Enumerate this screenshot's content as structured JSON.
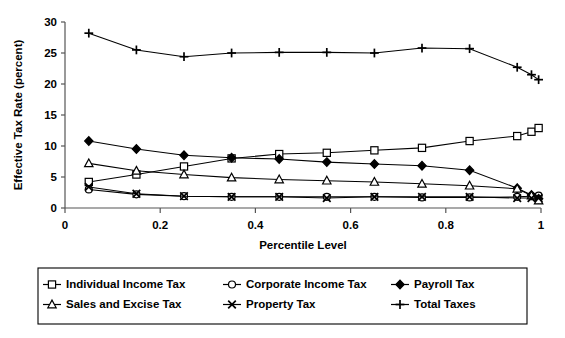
{
  "chart_data": {
    "type": "line",
    "title": "",
    "xlabel": "Percentile Level",
    "ylabel": "Effective Tax Rate (percent)",
    "xlim": [
      0,
      1
    ],
    "ylim": [
      0,
      30
    ],
    "xticks": [
      0,
      0.2,
      0.4,
      0.6,
      0.8,
      1
    ],
    "xticklabels": [
      "0",
      "0.2",
      "0.4",
      "0.6",
      "0.8",
      "1"
    ],
    "yticks": [
      0,
      5,
      10,
      15,
      20,
      25,
      30
    ],
    "yticklabels": [
      "0",
      "5",
      "10",
      "15",
      "20",
      "25",
      "30"
    ],
    "grid": false,
    "legend_position": "below-plot",
    "x": [
      0.05,
      0.15,
      0.25,
      0.35,
      0.45,
      0.55,
      0.65,
      0.75,
      0.85,
      0.95,
      0.98,
      0.995
    ],
    "series": [
      {
        "name": "Individual Income Tax",
        "marker": "square-open",
        "values": [
          4.2,
          5.4,
          6.7,
          8.0,
          8.7,
          8.9,
          9.3,
          9.7,
          10.8,
          11.6,
          12.3,
          12.9
        ]
      },
      {
        "name": "Corporate Income Tax",
        "marker": "circle-open",
        "values": [
          3.0,
          2.2,
          1.9,
          1.8,
          1.8,
          1.8,
          1.8,
          1.7,
          1.7,
          1.8,
          1.9,
          2.0
        ]
      },
      {
        "name": "Payroll Tax",
        "marker": "diamond-solid",
        "values": [
          10.8,
          9.5,
          8.5,
          8.1,
          7.9,
          7.4,
          7.1,
          6.8,
          6.1,
          3.2,
          2.1,
          1.5
        ]
      },
      {
        "name": "Sales and Excise Tax",
        "marker": "triangle-open",
        "values": [
          7.2,
          6.0,
          5.4,
          4.9,
          4.6,
          4.4,
          4.2,
          3.9,
          3.6,
          3.1,
          2.0,
          1.2
        ]
      },
      {
        "name": "Property Tax",
        "marker": "x-cross",
        "values": [
          3.4,
          2.3,
          1.9,
          1.8,
          1.8,
          1.6,
          1.8,
          1.8,
          1.8,
          1.6,
          1.6,
          1.6
        ]
      },
      {
        "name": "Total Taxes",
        "marker": "plus",
        "values": [
          28.2,
          25.5,
          24.4,
          25.0,
          25.1,
          25.1,
          25.0,
          25.8,
          25.7,
          22.7,
          21.5,
          20.7
        ]
      }
    ],
    "legend_rows": [
      [
        "Individual Income Tax",
        "Corporate Income Tax",
        "Payroll Tax"
      ],
      [
        "Sales and Excise Tax",
        "Property Tax",
        "Total Taxes"
      ]
    ]
  }
}
